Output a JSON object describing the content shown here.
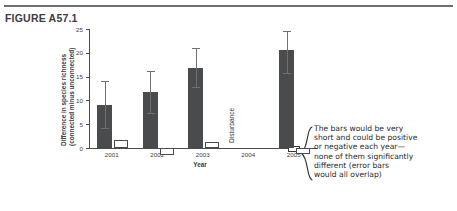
{
  "figure": {
    "title": "FIGURE A57.1"
  },
  "chart_data": {
    "type": "bar",
    "title": "",
    "xlabel": "Year",
    "ylabel": "Difference in species richness (connected minus unconnected)",
    "ylabel_line1": "Difference in species richness",
    "ylabel_line2": "(connected minus unconnected)",
    "categories": [
      "2001",
      "2002",
      "2003",
      "2004",
      "2005"
    ],
    "ylim": [
      -3,
      25
    ],
    "yticks": [
      0,
      5,
      10,
      15,
      20,
      25
    ],
    "ytick_labels": [
      "0",
      "5",
      "10",
      "15",
      "20",
      "25"
    ],
    "grid": false,
    "legend": "none",
    "series": [
      {
        "name": "Observed difference (filled bar)",
        "color": "#4a4b4d",
        "style": "filled",
        "values": [
          9.0,
          11.8,
          16.8,
          null,
          20.6
        ],
        "error_low": [
          4.2,
          7.3,
          12.8,
          null,
          15.7
        ],
        "error_high": [
          14.0,
          16.2,
          21.0,
          null,
          24.5
        ]
      },
      {
        "name": "Predicted difference (open bar)",
        "color": "#ffffff",
        "style": "open",
        "values": [
          1.6,
          -1.5,
          1.3,
          null,
          -1.3
        ],
        "error_low": [
          null,
          null,
          null,
          null,
          null
        ],
        "error_high": [
          null,
          null,
          null,
          null,
          null
        ]
      }
    ],
    "annotations": [
      {
        "name": "disturbance-marker",
        "text": "Disturbance",
        "x_category": "2004",
        "orientation": "vertical"
      }
    ]
  },
  "annotation": {
    "lines": [
      "The bars would be very",
      "short and could be positive",
      "or negative each year—",
      "none of them significantly",
      "different (error bars",
      "would all overlap)"
    ],
    "full_text": "The bars would be very short and could be positive or negative each year—none of them significantly different (error bars would all overlap)"
  }
}
